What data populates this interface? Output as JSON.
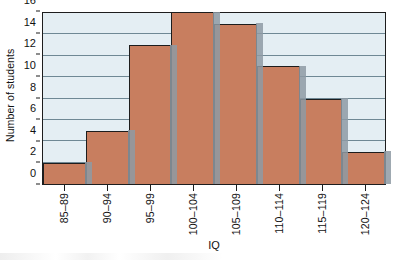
{
  "chart_data": {
    "type": "bar",
    "title": "",
    "xlabel": "IQ",
    "ylabel": "Number of students",
    "categories": [
      "85–89",
      "90–94",
      "95–99",
      "100–104",
      "105–109",
      "110–114",
      "115–119",
      "120–124"
    ],
    "values": [
      2,
      5,
      13,
      16,
      15,
      11,
      8,
      3
    ],
    "ylim": [
      0,
      16
    ],
    "ytick_labels": [
      "0",
      "2",
      "4",
      "6",
      "8",
      "10",
      "12",
      "14",
      "16"
    ],
    "ytick_values": [
      0,
      2,
      4,
      6,
      8,
      10,
      12,
      14,
      16
    ],
    "grid": "horizontal",
    "legend": "none",
    "colors": {
      "bar_fill": "#c87e5f",
      "bar_edge": "#1d1d1d",
      "bar_shadow": "#8e9aa3",
      "plot_background": "#e4eef3",
      "gridline": "#6f8894",
      "text": "#111111",
      "figure_background": "#ffffff"
    }
  }
}
